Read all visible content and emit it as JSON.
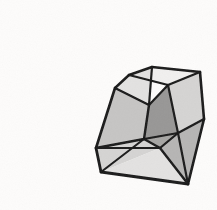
{
  "image": {
    "title": "Shaded polyhedron line drawing",
    "subject": "polyhedron",
    "width": 217,
    "height": 210,
    "background_color": "#fdfcfb",
    "ink_color": "#1a1a1a",
    "style": "hand-drawn shaded wireframe, grayscale"
  },
  "palette": {
    "background": "#fdfcfb",
    "stroke": "#1a1a1a",
    "face_lightest": "#f0efee",
    "face_light": "#e2e1e0",
    "face_mid_light": "#d3d2d1",
    "face_mid": "#c4c3c2",
    "face_mid_dark": "#b3b2b1",
    "face_dark": "#a2a1a0",
    "face_darkest": "#949392"
  },
  "geometry": {
    "description": "Convex polyhedron drawn in oblique projection with both silhouette edges and interior (near-side) edges visible through translucent shaded faces.",
    "vertices": {
      "top_apex": [
        152,
        67
      ],
      "top_right": [
        200,
        72
      ],
      "top_left": [
        115,
        88
      ],
      "upper_left_notch": [
        129,
        75
      ],
      "ridge_mid": [
        168,
        85
      ],
      "hub": [
        149,
        105
      ],
      "right": [
        204,
        119
      ],
      "left": [
        96,
        148
      ],
      "mid_right": [
        178,
        133
      ],
      "center_low": [
        144,
        139
      ],
      "bottom_left": [
        101,
        172
      ],
      "bottom": [
        188,
        184
      ],
      "lower_mid": [
        160,
        148
      ]
    },
    "faces": [
      {
        "name": "top-ridge-face",
        "shade": "face_lightest",
        "points": "129,75 152,67 200,72 168,85"
      },
      {
        "name": "upper-left-small-face",
        "shade": "face_light",
        "points": "115,88 129,75 152,67 149,105"
      },
      {
        "name": "right-upper-face",
        "shade": "face_mid_light",
        "points": "200,72 204,119 178,133 168,85"
      },
      {
        "name": "inner-shadow-face",
        "shade": "face_darkest",
        "points": "149,105 168,85 178,133 144,139"
      },
      {
        "name": "left-upper-face",
        "shade": "face_mid",
        "points": "115,88 149,105 144,139 96,148"
      },
      {
        "name": "left-lower-face",
        "shade": "face_mid_light",
        "points": "96,148 144,139 160,148 101,172"
      },
      {
        "name": "bottom-left-face",
        "shade": "face_light",
        "points": "101,172 160,148 188,184"
      },
      {
        "name": "bottom-right-face",
        "shade": "face_mid_dark",
        "points": "160,148 178,133 204,119 188,184"
      },
      {
        "name": "center-low-face",
        "shade": "face_dark",
        "points": "144,139 178,133 160,148"
      }
    ],
    "edges": [
      {
        "name": "edge-top-apex-to-top-right",
        "from": "top_apex",
        "to": "top_right",
        "weight": 2.6
      },
      {
        "name": "edge-top-right-to-right",
        "from": "top_right",
        "to": "right",
        "weight": 2.6
      },
      {
        "name": "edge-right-to-bottom",
        "from": "right",
        "to": "bottom",
        "weight": 2.6
      },
      {
        "name": "edge-bottom-to-bottom-left",
        "from": "bottom",
        "to": "bottom_left",
        "weight": 2.8
      },
      {
        "name": "edge-bottom-left-to-left",
        "from": "bottom_left",
        "to": "left",
        "weight": 2.8
      },
      {
        "name": "edge-left-to-top-left",
        "from": "left",
        "to": "top_left",
        "weight": 2.6
      },
      {
        "name": "edge-top-left-to-notch",
        "from": "top_left",
        "to": "upper_left_notch",
        "weight": 2.4
      },
      {
        "name": "edge-notch-to-top-apex",
        "from": "upper_left_notch",
        "to": "top_apex",
        "weight": 2.4
      },
      {
        "name": "edge-notch-to-ridge-mid",
        "from": "upper_left_notch",
        "to": "ridge_mid",
        "weight": 2.2
      },
      {
        "name": "edge-top-apex-to-hub",
        "from": "top_apex",
        "to": "hub",
        "weight": 2.2
      },
      {
        "name": "edge-ridge-mid-to-hub",
        "from": "ridge_mid",
        "to": "hub",
        "weight": 2.2
      },
      {
        "name": "edge-ridge-mid-to-top-right",
        "from": "ridge_mid",
        "to": "top_right",
        "weight": 2.2
      },
      {
        "name": "edge-ridge-mid-to-mid-right",
        "from": "ridge_mid",
        "to": "mid_right",
        "weight": 2.2
      },
      {
        "name": "edge-hub-to-top-left",
        "from": "hub",
        "to": "top_left",
        "weight": 2.2
      },
      {
        "name": "edge-hub-to-center-low",
        "from": "hub",
        "to": "center_low",
        "weight": 2.4
      },
      {
        "name": "edge-center-low-to-mid-right",
        "from": "center_low",
        "to": "mid_right",
        "weight": 2.2
      },
      {
        "name": "edge-center-low-to-left",
        "from": "center_low",
        "to": "left",
        "weight": 2.4
      },
      {
        "name": "edge-center-low-to-lower-mid",
        "from": "center_low",
        "to": "lower_mid",
        "weight": 2.2
      },
      {
        "name": "edge-lower-mid-to-mid-right",
        "from": "lower_mid",
        "to": "mid_right",
        "weight": 2.2
      },
      {
        "name": "edge-mid-right-to-right",
        "from": "mid_right",
        "to": "right",
        "weight": 2.2
      },
      {
        "name": "edge-mid-right-to-bottom",
        "from": "mid_right",
        "to": "bottom",
        "weight": 2.2
      },
      {
        "name": "edge-lower-mid-to-bottom",
        "from": "lower_mid",
        "to": "bottom",
        "weight": 2.4
      },
      {
        "name": "edge-left-to-lower-mid",
        "from": "left",
        "to": "lower_mid",
        "weight": 2.2
      },
      {
        "name": "edge-bottom-left-to-center-low",
        "from": "bottom_left",
        "to": "center_low",
        "weight": 2.0
      }
    ]
  }
}
